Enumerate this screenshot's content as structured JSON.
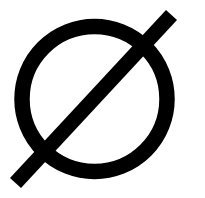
{
  "symbol": {
    "name": "empty-set / diameter symbol",
    "glyph": "Ø",
    "color": "#000000",
    "background": "#ffffff",
    "circle": {
      "cx": 94.5,
      "cy": 99,
      "r": 72.5,
      "stroke_width": 15.5
    },
    "slash": {
      "x1": 171.5,
      "y1": 15,
      "x2": 15.5,
      "y2": 183,
      "stroke_width": 15
    }
  }
}
